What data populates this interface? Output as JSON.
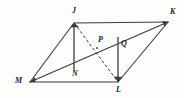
{
  "figure": {
    "type": "geometry-diagram",
    "canvas": {
      "width": 184,
      "height": 98
    },
    "background_color": "#fdfdfc",
    "stroke_color": "#3a3a3a",
    "label_color": "#1b1b1b",
    "points": [
      {
        "id": "J",
        "label": "J",
        "x": 74,
        "y": 23,
        "label_x": 72,
        "label_y": 7,
        "kind": "vertex"
      },
      {
        "id": "K",
        "label": "K",
        "x": 168,
        "y": 22,
        "label_x": 170,
        "label_y": 8,
        "kind": "vertex"
      },
      {
        "id": "L",
        "label": "L",
        "x": 118,
        "y": 82,
        "label_x": 116,
        "label_y": 86,
        "kind": "vertex"
      },
      {
        "id": "M",
        "label": "M",
        "x": 30,
        "y": 82,
        "label_x": 15,
        "label_y": 77,
        "kind": "vertex"
      },
      {
        "id": "N",
        "label": "N",
        "x": 74,
        "y": 68,
        "label_x": 72,
        "label_y": 70,
        "kind": "interior"
      },
      {
        "id": "P",
        "label": "P",
        "x": 97,
        "y": 48,
        "label_x": 98,
        "label_y": 36,
        "kind": "interior"
      },
      {
        "id": "Q",
        "label": "Q",
        "x": 118,
        "y": 37,
        "label_x": 121,
        "label_y": 40,
        "kind": "interior"
      }
    ],
    "segments": [
      {
        "id": "JK",
        "from": "J",
        "to": "K",
        "style": "solid",
        "name": "side-jk"
      },
      {
        "id": "KL",
        "from": "K",
        "to": "L",
        "style": "solid",
        "name": "side-kl"
      },
      {
        "id": "LM",
        "from": "L",
        "to": "M",
        "style": "solid",
        "name": "side-lm"
      },
      {
        "id": "MJ",
        "from": "M",
        "to": "J",
        "style": "solid",
        "name": "side-mj"
      },
      {
        "id": "MK",
        "from": "M",
        "to": "K",
        "style": "solid",
        "name": "diagonal-mk"
      },
      {
        "id": "JL",
        "from": "J",
        "to": "L",
        "style": "dashed",
        "name": "diagonal-jl"
      },
      {
        "id": "JN",
        "from": "J",
        "to": "N",
        "style": "solid",
        "name": "altitude-jn"
      },
      {
        "id": "QL",
        "from": "Q",
        "to": "L",
        "style": "solid",
        "name": "altitude-ql"
      }
    ],
    "arrow_markers": [
      {
        "at": "J",
        "name": "arrowhead-at-j"
      },
      {
        "at": "K",
        "name": "arrowhead-at-k"
      },
      {
        "at": "L",
        "name": "arrowhead-at-l"
      },
      {
        "at": "M",
        "name": "arrowhead-at-m"
      }
    ]
  }
}
